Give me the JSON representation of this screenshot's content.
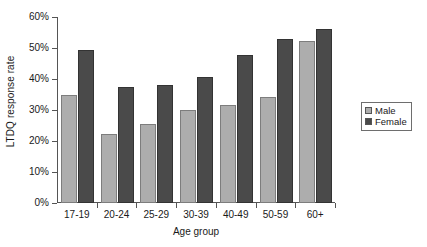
{
  "chart_data": {
    "type": "bar",
    "title": "",
    "xlabel": "Age group",
    "ylabel": "LTDQ response rate",
    "categories": [
      "17-19",
      "20-24",
      "25-29",
      "30-39",
      "40-49",
      "50-59",
      "60+"
    ],
    "series": [
      {
        "name": "Male",
        "color": "#adadad",
        "values": [
          34.8,
          22.4,
          25.5,
          30.0,
          31.7,
          34.2,
          52.3
        ]
      },
      {
        "name": "Female",
        "color": "#4a4a4a",
        "values": [
          49.3,
          37.5,
          38.0,
          40.6,
          47.8,
          52.8,
          56.2
        ]
      }
    ],
    "ylim": [
      0,
      60
    ],
    "ytick_values": [
      0,
      10,
      20,
      30,
      40,
      50,
      60
    ],
    "ytick_labels": [
      "0%",
      "10%",
      "20%",
      "30%",
      "40%",
      "50%",
      "60%"
    ],
    "grid": false,
    "legend_position": "right",
    "value_unit": "percent"
  },
  "legend": {
    "items": [
      {
        "label": "Male"
      },
      {
        "label": "Female"
      }
    ]
  }
}
